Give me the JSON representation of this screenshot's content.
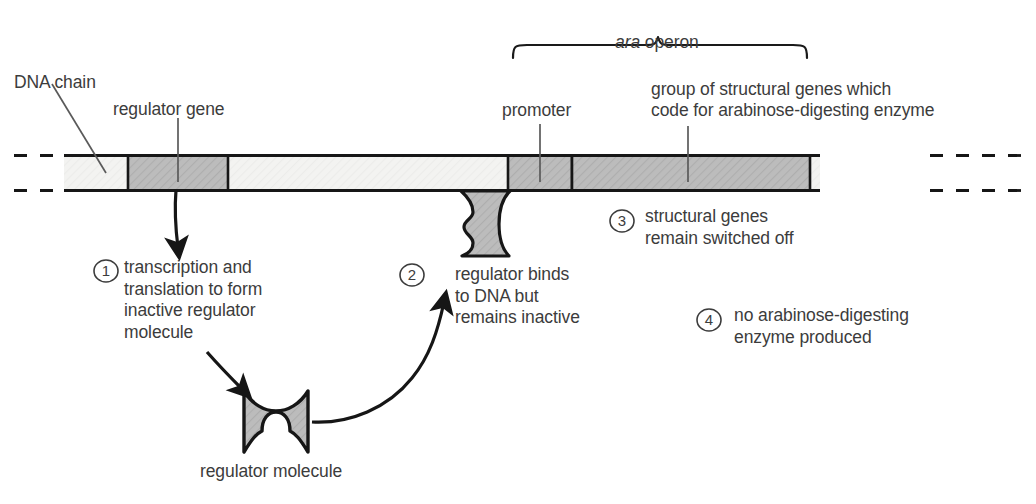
{
  "diagram": {
    "colors": {
      "gene_fill": "#b9b9b9",
      "dna_fill": "#f2f2f0",
      "outline": "#1a1a1a",
      "text": "#3c3c3c"
    },
    "labels": {
      "dna_chain": "DNA chain",
      "regulator_gene": "regulator gene",
      "promoter": "promoter",
      "operon_italic": "ara",
      "operon_rest": " operon",
      "structural_genes_line1": "group of structural genes which",
      "structural_genes_line2": "code for arabinose-digesting enzyme",
      "regulator_molecule": "regulator molecule"
    },
    "steps": [
      {
        "number": "1",
        "lines": [
          "transcription and",
          "translation to form",
          "inactive regulator",
          "molecule"
        ]
      },
      {
        "number": "2",
        "lines": [
          "regulator binds",
          "to DNA but",
          "remains inactive"
        ]
      },
      {
        "number": "3",
        "lines": [
          "structural genes",
          "remain switched off"
        ]
      },
      {
        "number": "4",
        "lines": [
          "no arabinose-digesting",
          "enzyme produced"
        ]
      }
    ]
  }
}
